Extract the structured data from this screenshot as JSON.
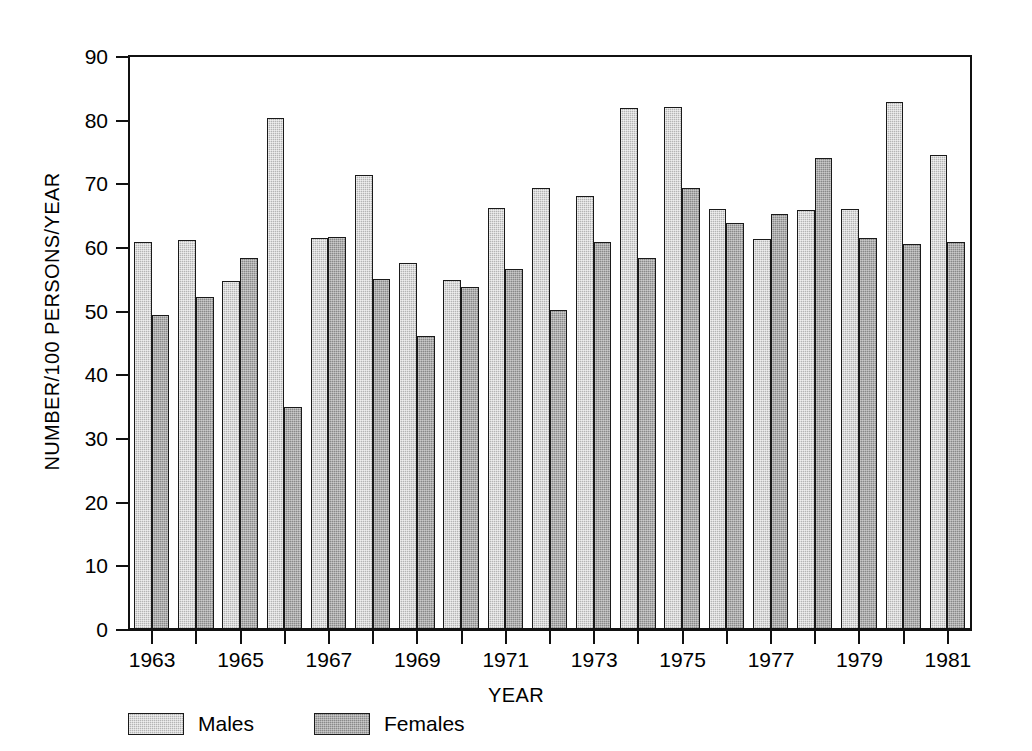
{
  "chart_data": {
    "type": "bar",
    "title": "",
    "xlabel": "YEAR",
    "ylabel": "NUMBER/100 PERSONS/YEAR",
    "ylim": [
      0,
      90
    ],
    "ytick_values": [
      0,
      10,
      20,
      30,
      40,
      50,
      60,
      70,
      80,
      90
    ],
    "ytick_labels": [
      "0",
      "10",
      "20",
      "30",
      "40",
      "50",
      "60",
      "70",
      "80",
      "90"
    ],
    "grid": false,
    "legend_position": "below-axes-left",
    "categories": [
      "1963",
      "1964",
      "1965",
      "1966",
      "1967",
      "1968",
      "1969",
      "1970",
      "1971",
      "1972",
      "1973",
      "1974",
      "1975",
      "1976",
      "1977",
      "1978",
      "1979",
      "1980",
      "1981"
    ],
    "xtick_labels_shown": [
      "1963",
      "1965",
      "1967",
      "1969",
      "1971",
      "1973",
      "1975",
      "1977",
      "1979",
      "1981"
    ],
    "series": [
      {
        "name": "Males",
        "color": "#b4b4b4",
        "values": [
          61.0,
          61.3,
          54.8,
          80.4,
          61.6,
          71.5,
          57.6,
          54.9,
          66.3,
          69.5,
          68.1,
          82.0,
          82.2,
          66.2,
          61.4,
          66.0,
          66.2,
          83.0,
          74.6
        ]
      },
      {
        "name": "Females",
        "color": "#898989",
        "values": [
          49.5,
          52.3,
          58.4,
          35.0,
          61.7,
          55.1,
          46.2,
          53.8,
          56.7,
          50.3,
          61.0,
          58.5,
          69.4,
          63.9,
          65.3,
          74.1,
          61.5,
          60.6,
          61.0
        ]
      }
    ]
  },
  "legend": {
    "items": [
      {
        "label": "Males",
        "swatch": "male-swatch-icon"
      },
      {
        "label": "Females",
        "swatch": "female-swatch-icon"
      }
    ]
  }
}
